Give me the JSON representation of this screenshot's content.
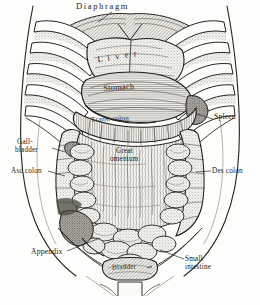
{
  "figure": {
    "title": "Diaphragm",
    "style": "engraving",
    "colors": {
      "background": "#fdfdfb",
      "ink": "#1b1b1b",
      "shading": "#9a9a94",
      "deep_shadow": "#3a3a36",
      "organ_fill": "#f4f2ec"
    }
  },
  "labels": {
    "diaphragm": {
      "text": "Diaphragm",
      "x": 93,
      "y": 3
    },
    "liver": {
      "text": "L i v e r",
      "x": 102,
      "y": 56
    },
    "stomach": {
      "text": "Stomach",
      "x": 105,
      "y": 86
    },
    "spleen": {
      "text": "Spleen",
      "x": 215,
      "y": 117
    },
    "gallbladder_line1": {
      "text": "Gall-",
      "x": 18,
      "y": 140
    },
    "gallbladder_line2": {
      "text": "bladder",
      "x": 18,
      "y": 148
    },
    "trans_colon": {
      "text": "Trans. colon",
      "x": 92,
      "y": 119
    },
    "great_omentum_line1": {
      "text": "Great",
      "x": 118,
      "y": 150
    },
    "great_omentum_line2": {
      "text": "omentum",
      "x": 113,
      "y": 158
    },
    "asc_colon": {
      "text": "Asc colon",
      "x": 12,
      "y": 172
    },
    "des_colon": {
      "text": "Des colon",
      "x": 212,
      "y": 172
    },
    "appendix": {
      "text": "Appendix",
      "x": 33,
      "y": 252
    },
    "bladder": {
      "text": "Bladder",
      "x": 113,
      "y": 267
    },
    "small_intestine_line1": {
      "text": "Small",
      "x": 186,
      "y": 258
    },
    "small_intestine_line2": {
      "text": "intestine",
      "x": 186,
      "y": 266
    }
  },
  "leaders": [
    {
      "name": "diaphragm-leader",
      "from": [
        110,
        12
      ],
      "to": [
        95,
        22
      ]
    },
    {
      "name": "spleen-leader",
      "from": [
        213,
        119
      ],
      "to": [
        196,
        114
      ]
    },
    {
      "name": "gallbladder-leader",
      "from": [
        52,
        148
      ],
      "to": [
        64,
        152
      ]
    },
    {
      "name": "asc-colon-leader",
      "from": [
        48,
        172
      ],
      "to": [
        64,
        176
      ]
    },
    {
      "name": "des-colon-leader",
      "from": [
        211,
        172
      ],
      "to": [
        196,
        172
      ]
    },
    {
      "name": "appendix-leader",
      "from": [
        67,
        252
      ],
      "to": [
        100,
        238
      ]
    },
    {
      "name": "small-intestine-leader",
      "from": [
        184,
        260
      ],
      "to": [
        160,
        250
      ]
    }
  ],
  "organs": [
    {
      "name": "diaphragm",
      "region": "upper-central"
    },
    {
      "name": "rib-cage-left",
      "region": "upper-left"
    },
    {
      "name": "rib-cage-right",
      "region": "upper-right"
    },
    {
      "name": "liver",
      "region": "upper-central"
    },
    {
      "name": "stomach",
      "region": "upper-central"
    },
    {
      "name": "spleen",
      "region": "upper-right"
    },
    {
      "name": "gallbladder",
      "region": "mid-left"
    },
    {
      "name": "transverse-colon",
      "region": "mid-central"
    },
    {
      "name": "great-omentum",
      "region": "mid-central"
    },
    {
      "name": "ascending-colon",
      "region": "mid-left"
    },
    {
      "name": "descending-colon",
      "region": "mid-right"
    },
    {
      "name": "small-intestine",
      "region": "lower-central"
    },
    {
      "name": "appendix",
      "region": "lower-left"
    },
    {
      "name": "bladder",
      "region": "lower-central"
    }
  ]
}
